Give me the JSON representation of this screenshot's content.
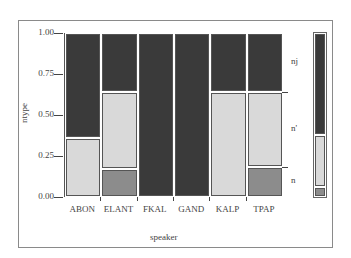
{
  "chart_data": {
    "type": "bar",
    "stacked": true,
    "normalized": true,
    "title": "",
    "xlabel": "speaker",
    "ylabel": "ntype",
    "ylim": [
      0,
      1
    ],
    "yticks": [
      "0.00",
      "0.25",
      "0.50",
      "0.75",
      "1.00"
    ],
    "categories": [
      "ABON",
      "ELANT",
      "FKAL",
      "GAND",
      "KALP",
      "TPAP"
    ],
    "series": [
      {
        "name": "n",
        "color": "#8c8c8c",
        "values": [
          0.0,
          0.17,
          0.0,
          0.0,
          0.0,
          0.18
        ]
      },
      {
        "name": "n'",
        "color": "#d9d9d9",
        "values": [
          0.36,
          0.47,
          0.0,
          0.0,
          0.64,
          0.46
        ]
      },
      {
        "name": "nj",
        "color": "#3a3a3a",
        "values": [
          0.64,
          0.36,
          1.0,
          1.0,
          0.36,
          0.36
        ]
      }
    ],
    "legend": {
      "position": "right",
      "entries": [
        "nj",
        "n'",
        "n"
      ]
    },
    "grid": false
  }
}
